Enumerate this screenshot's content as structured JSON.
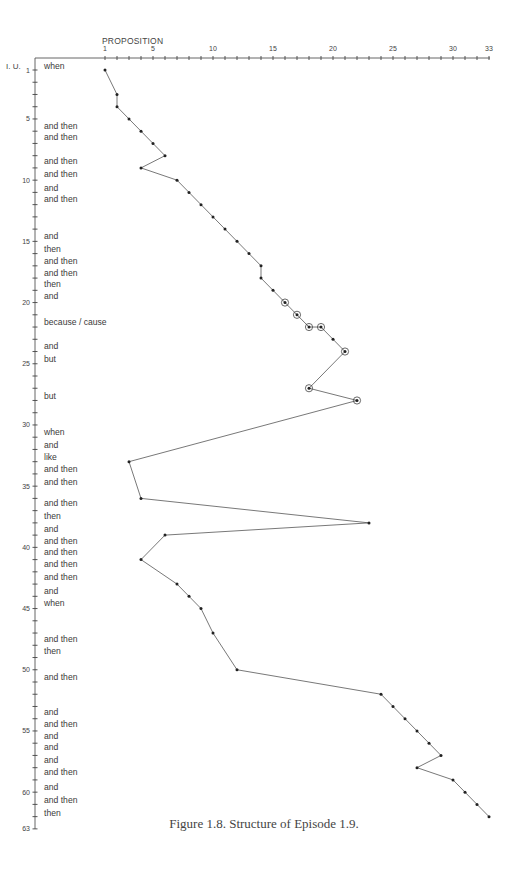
{
  "figure": {
    "caption": "Figure 1.8. Structure of Episode 1.9.",
    "x_axis_title": "PROPOSITION",
    "y_axis_title": "I. U."
  },
  "chart_data": {
    "type": "line",
    "title": "Structure of Episode 1.9",
    "caption": "Figure 1.8. Structure of Episode 1.9.",
    "xlabel": "PROPOSITION",
    "ylabel": "I. U.",
    "x_axis_position": "top",
    "y_axis_inverted": true,
    "xlim": [
      1,
      33
    ],
    "ylim": [
      1,
      63
    ],
    "x_tick_labels": [
      1,
      5,
      10,
      15,
      20,
      25,
      30,
      33
    ],
    "y_tick_labels": [
      1,
      5,
      10,
      15,
      20,
      25,
      30,
      35,
      40,
      45,
      50,
      55,
      60,
      63
    ],
    "grid": false,
    "legend": null,
    "series": [
      {
        "name": "episode-1.9-path",
        "points": [
          {
            "iu": 1,
            "proposition": 1
          },
          {
            "iu": 3,
            "proposition": 2
          },
          {
            "iu": 4,
            "proposition": 2
          },
          {
            "iu": 5,
            "proposition": 3
          },
          {
            "iu": 6,
            "proposition": 4
          },
          {
            "iu": 7,
            "proposition": 5
          },
          {
            "iu": 8,
            "proposition": 6
          },
          {
            "iu": 9,
            "proposition": 4
          },
          {
            "iu": 10,
            "proposition": 7
          },
          {
            "iu": 11,
            "proposition": 8
          },
          {
            "iu": 12,
            "proposition": 9
          },
          {
            "iu": 13,
            "proposition": 10
          },
          {
            "iu": 14,
            "proposition": 11
          },
          {
            "iu": 15,
            "proposition": 12
          },
          {
            "iu": 16,
            "proposition": 13
          },
          {
            "iu": 17,
            "proposition": 14
          },
          {
            "iu": 18,
            "proposition": 14
          },
          {
            "iu": 19,
            "proposition": 15
          },
          {
            "iu": 20,
            "proposition": 16,
            "circled": true
          },
          {
            "iu": 21,
            "proposition": 17,
            "circled": true
          },
          {
            "iu": 22,
            "proposition": 18,
            "circled": true
          },
          {
            "iu": 22,
            "proposition": 19,
            "circled": true
          },
          {
            "iu": 23,
            "proposition": 20
          },
          {
            "iu": 24,
            "proposition": 21,
            "circled": true
          },
          {
            "iu": 27,
            "proposition": 18,
            "circled": true
          },
          {
            "iu": 28,
            "proposition": 22,
            "circled": true
          },
          {
            "iu": 33,
            "proposition": 3
          },
          {
            "iu": 36,
            "proposition": 4
          },
          {
            "iu": 38,
            "proposition": 23
          },
          {
            "iu": 39,
            "proposition": 6
          },
          {
            "iu": 41,
            "proposition": 4
          },
          {
            "iu": 43,
            "proposition": 7
          },
          {
            "iu": 44,
            "proposition": 8
          },
          {
            "iu": 45,
            "proposition": 9
          },
          {
            "iu": 47,
            "proposition": 10
          },
          {
            "iu": 50,
            "proposition": 12
          },
          {
            "iu": 52,
            "proposition": 24
          },
          {
            "iu": 53,
            "proposition": 25
          },
          {
            "iu": 54,
            "proposition": 26
          },
          {
            "iu": 55,
            "proposition": 27
          },
          {
            "iu": 56,
            "proposition": 28
          },
          {
            "iu": 57,
            "proposition": 29
          },
          {
            "iu": 58,
            "proposition": 27
          },
          {
            "iu": 59,
            "proposition": 30
          },
          {
            "iu": 60,
            "proposition": 31
          },
          {
            "iu": 61,
            "proposition": 32
          },
          {
            "iu": 62,
            "proposition": 33
          }
        ]
      }
    ],
    "annotations": [
      {
        "y": 66,
        "text": "when"
      },
      {
        "y": 126,
        "text": "and then"
      },
      {
        "y": 137,
        "text": "and then"
      },
      {
        "y": 161,
        "text": "and then"
      },
      {
        "y": 174,
        "text": "and then"
      },
      {
        "y": 188,
        "text": "and"
      },
      {
        "y": 199,
        "text": "and then"
      },
      {
        "y": 236,
        "text": "and"
      },
      {
        "y": 249,
        "text": "then"
      },
      {
        "y": 261,
        "text": "and then"
      },
      {
        "y": 273,
        "text": "and then"
      },
      {
        "y": 284,
        "text": "then"
      },
      {
        "y": 296,
        "text": "and"
      },
      {
        "y": 322,
        "text": "because / cause"
      },
      {
        "y": 346,
        "text": "and"
      },
      {
        "y": 359,
        "text": "but"
      },
      {
        "y": 396,
        "text": "but"
      },
      {
        "y": 432,
        "text": "when"
      },
      {
        "y": 445,
        "text": "and"
      },
      {
        "y": 457,
        "text": "like"
      },
      {
        "y": 469,
        "text": "and then"
      },
      {
        "y": 482,
        "text": "and then"
      },
      {
        "y": 503,
        "text": "and then"
      },
      {
        "y": 516,
        "text": "then"
      },
      {
        "y": 529,
        "text": "and"
      },
      {
        "y": 541,
        "text": "and then"
      },
      {
        "y": 552,
        "text": "and then"
      },
      {
        "y": 564,
        "text": "and then"
      },
      {
        "y": 577,
        "text": "and then"
      },
      {
        "y": 591,
        "text": "and"
      },
      {
        "y": 603,
        "text": "when"
      },
      {
        "y": 639,
        "text": "and then"
      },
      {
        "y": 651,
        "text": "then"
      },
      {
        "y": 677,
        "text": "and then"
      },
      {
        "y": 712,
        "text": "and"
      },
      {
        "y": 724,
        "text": "and then"
      },
      {
        "y": 736,
        "text": "and"
      },
      {
        "y": 747,
        "text": "and"
      },
      {
        "y": 760,
        "text": "and"
      },
      {
        "y": 772,
        "text": "and then"
      },
      {
        "y": 787,
        "text": "and"
      },
      {
        "y": 800,
        "text": "and then"
      },
      {
        "y": 813,
        "text": "then"
      }
    ]
  }
}
